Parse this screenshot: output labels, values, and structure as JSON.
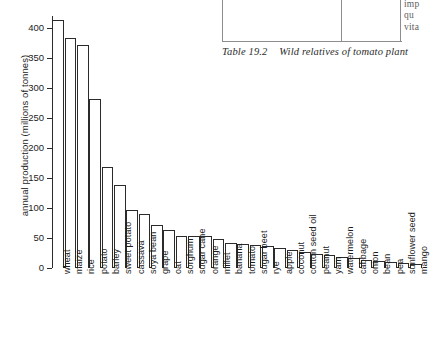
{
  "table_fragment": {
    "caption_number": "Table 19.2",
    "caption_text": "Wild relatives of tomato plant",
    "truncated_column_lines": [
      "me",
      "imp",
      "qu",
      "vita"
    ]
  },
  "chart_data": {
    "type": "bar",
    "title": "",
    "xlabel": "",
    "ylabel": "annual production (millions of tonnes)",
    "ylim": [
      0,
      420
    ],
    "ytick_values": [
      0,
      50,
      100,
      150,
      200,
      250,
      300,
      350,
      400
    ],
    "ytick_labels": [
      "0",
      "50",
      "100",
      "150",
      "200",
      "250",
      "300",
      "350",
      "400"
    ],
    "grid": false,
    "legend": "none",
    "categories": [
      "wheat",
      "maize",
      "rice",
      "potato",
      "barley",
      "sweet potato",
      "cassava",
      "soya bean",
      "grape",
      "oat",
      "sorghum",
      "sugar cane",
      "orange",
      "millet",
      "banana",
      "tomato",
      "sugar beet",
      "rye",
      "apple",
      "coconut",
      "cotton seed oil",
      "peanut",
      "yam",
      "watermelon",
      "cabbage",
      "onion",
      "bean",
      "pea",
      "sunflower seed",
      "mango"
    ],
    "values": [
      413,
      383,
      372,
      282,
      168,
      139,
      96,
      90,
      72,
      64,
      53,
      53,
      53,
      48,
      42,
      40,
      38,
      36,
      33,
      30,
      26,
      23,
      21,
      18,
      16,
      14,
      12,
      10,
      9,
      7
    ]
  }
}
